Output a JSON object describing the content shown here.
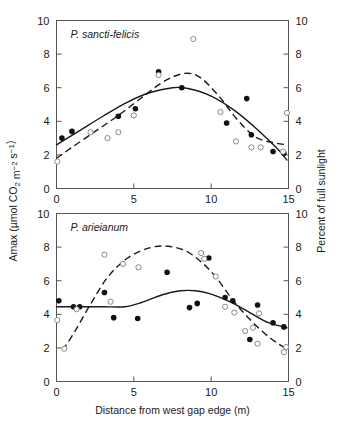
{
  "figure": {
    "axis_titles": {
      "y_left": "Amax (µmol CO₂ m⁻² s⁻¹)",
      "y_right": "Percent of full sunlight",
      "x": "Distance from west gap edge (m)"
    },
    "x_ticks": [
      "0",
      "5",
      "10",
      "15"
    ],
    "y_ticks": [
      "0",
      "2",
      "4",
      "6",
      "8",
      "10"
    ],
    "colors": {
      "frame": "#555555",
      "filled_marker": "#111111",
      "open_marker_edge": "#8a8a8a",
      "curve": "#1a1a1a",
      "background": "#ffffff"
    }
  },
  "chart_data": [
    {
      "type": "scatter",
      "panel": "top",
      "title": "P. sancti-felicis",
      "xlabel": "Distance from west gap edge (m)",
      "ylabel": "Amax (µmol CO₂ m⁻² s⁻¹)",
      "ylabel_right": "Percent of full sunlight",
      "xlim": [
        0,
        15
      ],
      "ylim": [
        0,
        10
      ],
      "ylim_right": [
        0,
        10
      ],
      "grid": false,
      "legend": "none",
      "series": [
        {
          "name": "Amax (filled circles)",
          "marker": "filled-circle",
          "axis": "left",
          "points": [
            [
              0.35,
              3.0
            ],
            [
              1.0,
              3.4
            ],
            [
              4.0,
              4.3
            ],
            [
              5.1,
              4.75
            ],
            [
              6.6,
              6.95
            ],
            [
              8.1,
              6.0
            ],
            [
              11.0,
              3.9
            ],
            [
              12.3,
              5.35
            ],
            [
              12.6,
              3.2
            ],
            [
              14.0,
              2.2
            ],
            [
              14.7,
              2.1
            ]
          ]
        },
        {
          "name": "Percent of full sunlight (open circles)",
          "marker": "open-circle",
          "axis": "right",
          "points": [
            [
              0.05,
              1.6
            ],
            [
              2.2,
              3.35
            ],
            [
              3.3,
              3.0
            ],
            [
              4.0,
              3.35
            ],
            [
              5.0,
              4.35
            ],
            [
              6.6,
              6.75
            ],
            [
              8.85,
              8.9
            ],
            [
              10.6,
              4.55
            ],
            [
              11.6,
              2.8
            ],
            [
              12.6,
              2.45
            ],
            [
              13.2,
              2.45
            ],
            [
              14.65,
              2.2
            ],
            [
              14.9,
              4.5
            ]
          ]
        }
      ],
      "fits": [
        {
          "name": "Amax fit (solid)",
          "style": "solid",
          "points": [
            [
              0.0,
              2.6
            ],
            [
              1.5,
              3.45
            ],
            [
              3.0,
              4.3
            ],
            [
              4.5,
              5.1
            ],
            [
              6.0,
              5.7
            ],
            [
              7.5,
              6.0
            ],
            [
              8.5,
              5.95
            ],
            [
              10.0,
              5.5
            ],
            [
              11.5,
              4.65
            ],
            [
              13.0,
              3.5
            ],
            [
              14.3,
              2.35
            ],
            [
              14.9,
              1.7
            ]
          ]
        },
        {
          "name": "Light fit (dashed)",
          "style": "dashed",
          "points": [
            [
              0.0,
              1.8
            ],
            [
              1.0,
              2.45
            ],
            [
              2.5,
              3.4
            ],
            [
              4.0,
              4.35
            ],
            [
              5.5,
              5.4
            ],
            [
              7.0,
              6.4
            ],
            [
              8.3,
              6.85
            ],
            [
              9.3,
              6.6
            ],
            [
              10.5,
              5.5
            ],
            [
              11.6,
              4.2
            ],
            [
              12.8,
              3.1
            ],
            [
              13.9,
              2.75
            ],
            [
              14.9,
              2.6
            ]
          ]
        }
      ]
    },
    {
      "type": "scatter",
      "panel": "bottom",
      "title": "P. arieianum",
      "xlabel": "Distance from west gap edge (m)",
      "ylabel": "Amax (µmol CO₂ m⁻² s⁻¹)",
      "ylabel_right": "Percent of full sunlight",
      "xlim": [
        0,
        15
      ],
      "ylim": [
        0,
        10
      ],
      "ylim_right": [
        0,
        10
      ],
      "grid": false,
      "legend": "none",
      "series": [
        {
          "name": "Amax (filled circles)",
          "marker": "filled-circle",
          "axis": "left",
          "points": [
            [
              0.15,
              4.8
            ],
            [
              1.1,
              4.45
            ],
            [
              1.5,
              4.45
            ],
            [
              3.1,
              5.3
            ],
            [
              3.7,
              3.8
            ],
            [
              5.25,
              3.75
            ],
            [
              7.15,
              6.5
            ],
            [
              8.6,
              4.4
            ],
            [
              9.1,
              4.65
            ],
            [
              9.85,
              7.35
            ],
            [
              10.9,
              5.0
            ],
            [
              11.4,
              4.8
            ],
            [
              12.5,
              2.5
            ],
            [
              13.0,
              4.55
            ],
            [
              14.0,
              3.5
            ],
            [
              14.7,
              3.25
            ]
          ]
        },
        {
          "name": "Percent of full sunlight (open circles)",
          "marker": "open-circle",
          "axis": "right",
          "points": [
            [
              0.05,
              3.65
            ],
            [
              0.5,
              1.95
            ],
            [
              1.3,
              4.3
            ],
            [
              3.1,
              7.55
            ],
            [
              3.5,
              4.75
            ],
            [
              4.3,
              7.0
            ],
            [
              5.3,
              6.8
            ],
            [
              9.35,
              7.65
            ],
            [
              9.55,
              7.3
            ],
            [
              10.3,
              6.25
            ],
            [
              10.9,
              4.45
            ],
            [
              11.5,
              4.1
            ],
            [
              12.2,
              3.0
            ],
            [
              12.7,
              3.2
            ],
            [
              13.0,
              2.25
            ],
            [
              13.1,
              4.05
            ],
            [
              14.7,
              1.75
            ],
            [
              14.85,
              2.05
            ]
          ]
        }
      ],
      "fits": [
        {
          "name": "Amax fit (solid)",
          "style": "solid",
          "points": [
            [
              0.0,
              4.45
            ],
            [
              1.5,
              4.45
            ],
            [
              3.0,
              4.45
            ],
            [
              4.4,
              4.45
            ],
            [
              5.5,
              4.7
            ],
            [
              6.8,
              5.15
            ],
            [
              8.0,
              5.4
            ],
            [
              9.0,
              5.4
            ],
            [
              10.0,
              5.2
            ],
            [
              11.2,
              4.75
            ],
            [
              12.5,
              4.1
            ],
            [
              13.7,
              3.5
            ],
            [
              14.9,
              3.2
            ]
          ]
        },
        {
          "name": "Light fit (dashed)",
          "style": "dashed",
          "points": [
            [
              0.4,
              1.85
            ],
            [
              1.2,
              3.0
            ],
            [
              2.2,
              4.6
            ],
            [
              3.3,
              6.2
            ],
            [
              4.6,
              7.35
            ],
            [
              6.0,
              7.95
            ],
            [
              7.2,
              8.05
            ],
            [
              8.4,
              7.75
            ],
            [
              9.5,
              7.0
            ],
            [
              10.4,
              6.1
            ],
            [
              11.4,
              4.85
            ],
            [
              12.6,
              3.6
            ],
            [
              13.8,
              2.6
            ],
            [
              14.85,
              1.95
            ]
          ]
        }
      ]
    }
  ]
}
